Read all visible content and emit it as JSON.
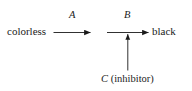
{
  "diagram": {
    "background_color": "#ffffff",
    "ink_color": "#1a1a1a",
    "nodes": {
      "reactant_label": "colorless",
      "product_label": "black",
      "inhibitor_label_italic": "C",
      "inhibitor_label_rest": " (inhibitor)",
      "inhibitor_label_full": "C (inhibitor)"
    },
    "arrows": {
      "first_step_label": "A",
      "second_step_label": "B",
      "first_step_from": "colorless",
      "second_step_to": "black",
      "inhibitor_arrow_direction": "up"
    }
  }
}
